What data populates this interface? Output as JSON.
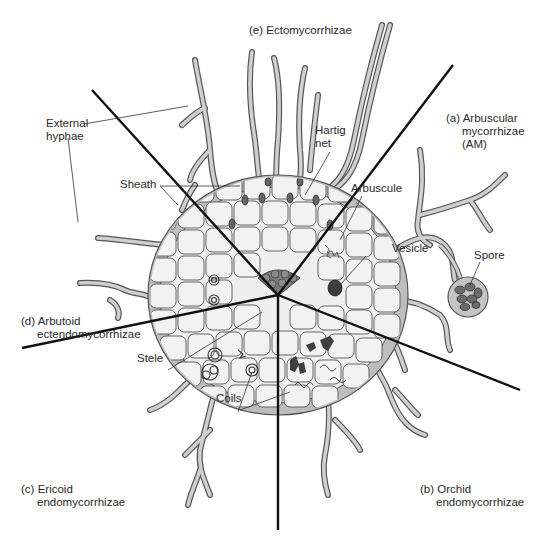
{
  "figure": {
    "colors": {
      "background": "#ffffff",
      "divider": "#111111",
      "cell_fill": "#efefef",
      "cell_stroke": "#555555",
      "sheath_fill": "#b8b8b8",
      "hypha_fill": "#c8c8c8",
      "stele_fill": "#7a7a7a",
      "dark_fill": "#4a4a4a",
      "text": "#2a2a2a"
    },
    "sectors": [
      {
        "id": "e",
        "prefix": "(e)",
        "line1": "Ectomycorrhizae",
        "line2": "",
        "line3": ""
      },
      {
        "id": "a",
        "prefix": "(a)",
        "line1": "Arbuscular",
        "line2": "mycorrhizae",
        "line3": "(AM)"
      },
      {
        "id": "b",
        "prefix": "(b)",
        "line1": "Orchid",
        "line2": "endomycorrhizae",
        "line3": ""
      },
      {
        "id": "c",
        "prefix": "(c)",
        "line1": "Ericoid",
        "line2": "endomycorrhizae",
        "line3": ""
      },
      {
        "id": "d",
        "prefix": "(d)",
        "line1": "Arbutoid",
        "line2": "ectendomycorrhizae",
        "line3": ""
      }
    ],
    "callouts": {
      "external_hyphae_1": "External",
      "external_hyphae_2": "hyphae",
      "hartig_1": "Hartig",
      "hartig_2": "net",
      "sheath": "Sheath",
      "arbuscule": "Arbuscule",
      "vesicle": "Vesicle",
      "spore": "Spore",
      "stele": "Stele",
      "coils": "Coils"
    }
  }
}
